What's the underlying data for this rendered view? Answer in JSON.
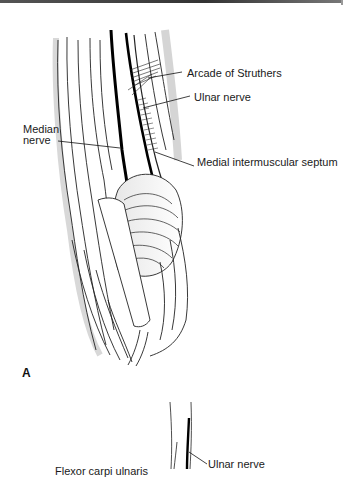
{
  "figure": {
    "panel_a": {
      "letter": "A",
      "labels": {
        "arcade": "Arcade of Struthers",
        "ulnar": "Ulnar nerve",
        "median_line1": "Median",
        "median_line2": "nerve",
        "septum": "Medial intermuscular septum"
      }
    },
    "panel_b": {
      "labels": {
        "ulnar": "Ulnar nerve",
        "fcu": "Flexor carpi ulnaris"
      }
    }
  }
}
